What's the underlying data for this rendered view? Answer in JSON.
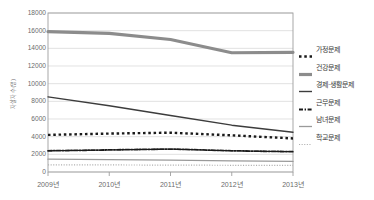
{
  "chart_data": {
    "type": "line",
    "title": "",
    "xlabel": "",
    "ylabel": "자살자 수(명)",
    "categories": [
      "2009년",
      "2010년",
      "2011년",
      "2012년",
      "2013년"
    ],
    "ylim": [
      0,
      18000
    ],
    "yticks": [
      0,
      2000,
      4000,
      6000,
      8000,
      10000,
      12000,
      14000,
      16000,
      18000
    ],
    "ytick_labels": [
      "0",
      "2000",
      "4000",
      "6000",
      "8000",
      "10000",
      "12000",
      "14000",
      "16000",
      "18000"
    ],
    "grid": true,
    "legend_position": "right",
    "series": [
      {
        "name": "가정문제",
        "values": [
          4200,
          4350,
          4450,
          4150,
          3800
        ],
        "color": "#1a1a1a",
        "style": "dotted-thick",
        "width": 2.4
      },
      {
        "name": "건강문제",
        "values": [
          15900,
          15700,
          15000,
          13500,
          13550
        ],
        "color": "#8c8c8c",
        "style": "solid",
        "width": 3.2
      },
      {
        "name": "경제·생활문제",
        "values": [
          8500,
          7500,
          6400,
          5300,
          4500
        ],
        "color": "#3c3c3c",
        "style": "solid",
        "width": 1.4
      },
      {
        "name": "근무문제",
        "values": [
          2400,
          2500,
          2600,
          2400,
          2300
        ],
        "color": "#1a1a1a",
        "style": "dash-dot",
        "width": 1.8
      },
      {
        "name": "남녀문제",
        "values": [
          1450,
          1400,
          1350,
          1250,
          1200
        ],
        "color": "#9a9a9a",
        "style": "solid",
        "width": 1.3
      },
      {
        "name": "학교문제",
        "values": [
          800,
          800,
          780,
          760,
          750
        ],
        "color": "#b0b0b0",
        "style": "dotted-fine",
        "width": 1.2
      }
    ]
  },
  "axes": {
    "frame_color": "#9e9e9e",
    "grid_color": "#d6d6d6",
    "tick_color": "#6b6b6b"
  }
}
